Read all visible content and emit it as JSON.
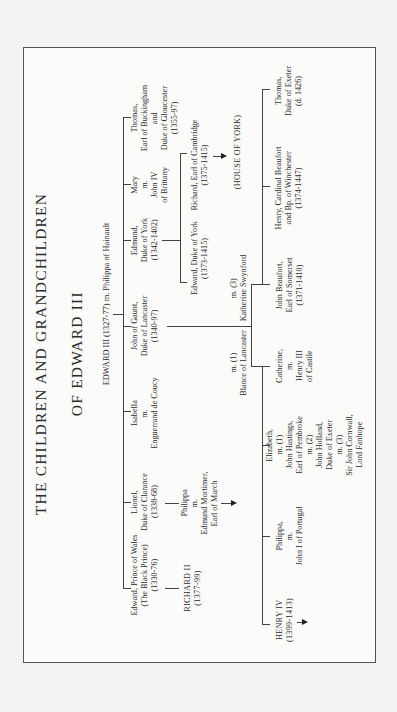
{
  "title": {
    "line1": "THE CHILDREN AND GRANDCHILDREN",
    "line2": "OF EDWARD III"
  },
  "root": "EDWARD III (1327-77) m. Philippa of Hainault",
  "children": [
    {
      "id": "edward",
      "text": "Edward, Prince of Wales\n(The Black Prince)\n(1330-76)"
    },
    {
      "id": "lionel",
      "text": "Lionel,\nDuke of Clarance\n(1338-68)"
    },
    {
      "id": "isabella",
      "text": "Isabella\nm.\nEnguerrand de Coucy"
    },
    {
      "id": "john",
      "text": "John of Gaunt,\nDuke of Lancaster\n(1340-97)"
    },
    {
      "id": "edmund",
      "text": "Edmund,\nDuke of York\n(1342-1402)"
    },
    {
      "id": "mary",
      "text": "Mary\nm.\nJohn IV\nof Brittany"
    },
    {
      "id": "thomas",
      "text": "Thomas,\nEarl of Buckingham\nand\nDuke of Gloucester\n(1355-97)"
    }
  ],
  "grandchildren_second_row": {
    "richard_ii": "RICHARD II\n(1377-99)",
    "philippa_clarence": "Philippa\nm.\nEdmund Mortimer,\nEarl of March",
    "marriage_1": "m. (1)\nBlance of Lancaster",
    "marriage_3": "m. (3)\nKatherine Swynford",
    "edward_york": "Edward, Duke of York\n(1373-1415)",
    "richard_cambridge": "Richard, Earl of Cambridge\n(1375-1415)",
    "house_of_york": "(HOUSE OF YORK)"
  },
  "lancaster_children": [
    {
      "id": "henry_iv",
      "text": "HENRY IV\n(1399-1413)"
    },
    {
      "id": "philippa",
      "text": "Philippa,\nm.\nJohn I of Portugal"
    },
    {
      "id": "elizabeth",
      "text": "Elizabeth,\nm. (1)\nJohn Hastings,\nEarl of Pembroke\nm. (2)\nJohn Holland,\nDuke of Exeter\nm. (3)\nSir John Cornwall,\nLord Fanhope"
    },
    {
      "id": "catherine",
      "text": "Catherine,\nm.\nHenry III\nof Castile"
    },
    {
      "id": "john_beaufort",
      "text": "John Beaufort,\nEarl of Somerset\n(1371-1410)"
    },
    {
      "id": "henry_beaufort",
      "text": "Henry, Cardinal Beaufort\nand Bp. of Winchester\n(1374-1447)"
    },
    {
      "id": "thomas_exeter",
      "text": "Thomas,\nDuke of Exeter\n(d. 1426)"
    }
  ]
}
